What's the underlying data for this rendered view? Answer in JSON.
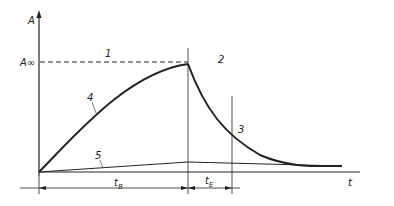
{
  "diagram": {
    "axes": {
      "y_label": "A",
      "x_label": "t",
      "y_marker": "A∞"
    },
    "curve_labels": [
      "1",
      "2",
      "3",
      "4",
      "5"
    ],
    "intervals": [
      {
        "symbol": "t",
        "subscript": "B"
      },
      {
        "symbol": "t",
        "subscript": "E"
      }
    ]
  }
}
